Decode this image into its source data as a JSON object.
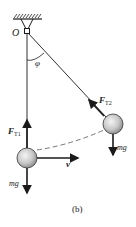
{
  "diagram": {
    "type": "pendulum-force-diagram",
    "caption": "(b)",
    "pivot_label": "O",
    "angle_label": "φ",
    "ball_bottom": {
      "tension_label": "F",
      "tension_sub": "T1",
      "weight_label": "mg",
      "velocity_label": "v"
    },
    "ball_displaced": {
      "tension_label": "F",
      "tension_sub": "T2",
      "weight_label": "mg"
    },
    "colors": {
      "line": "#1a1a1a",
      "ball_light": "#f2f2f2",
      "ball_dark": "#8a8a8a"
    }
  }
}
